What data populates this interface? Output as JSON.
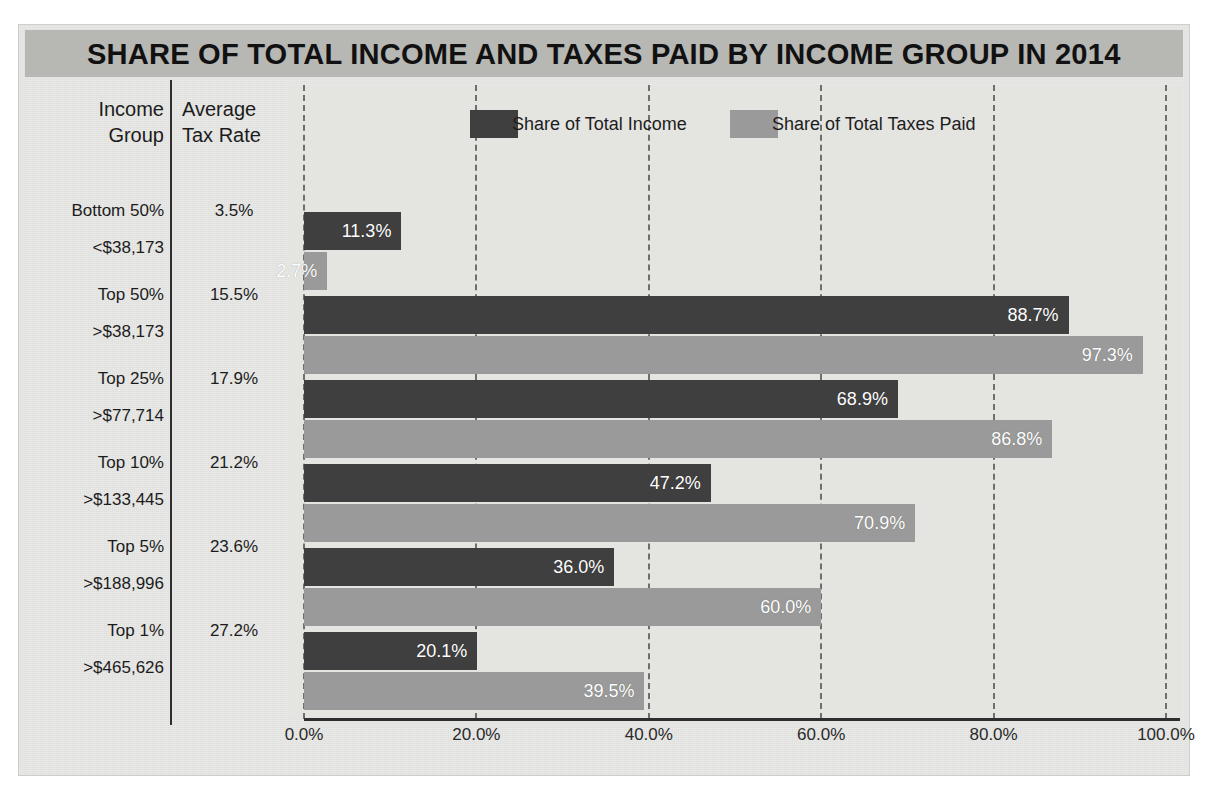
{
  "title": "SHARE OF TOTAL INCOME AND TAXES PAID BY INCOME GROUP IN 2014",
  "table": {
    "headers": {
      "income_group_line1": "Income",
      "income_group_line2": "Group",
      "avg_rate_line1": "Average",
      "avg_rate_line2": "Tax Rate"
    },
    "rows": [
      {
        "group": "Bottom 50%",
        "threshold": "<$38,173",
        "avg_tax_rate": "3.5%"
      },
      {
        "group": "Top 50%",
        "threshold": ">$38,173",
        "avg_tax_rate": "15.5%"
      },
      {
        "group": "Top 25%",
        "threshold": ">$77,714",
        "avg_tax_rate": "17.9%"
      },
      {
        "group": "Top 10%",
        "threshold": ">$133,445",
        "avg_tax_rate": "21.2%"
      },
      {
        "group": "Top 5%",
        "threshold": ">$188,996",
        "avg_tax_rate": "23.6%"
      },
      {
        "group": "Top 1%",
        "threshold": ">$465,626",
        "avg_tax_rate": "27.2%"
      }
    ]
  },
  "colors": {
    "income_bar": "#3f3f3f",
    "taxes_bar": "#9a9a9a",
    "title_bar_bg": "#b7b7b4",
    "plot_bg": "#e4e4e1",
    "gridline": "#6e6e6c"
  },
  "chart_data": {
    "type": "bar",
    "orientation": "horizontal",
    "title": "SHARE OF TOTAL INCOME AND TAXES PAID BY INCOME GROUP IN 2014",
    "xlabel": "",
    "ylabel": "",
    "categories": [
      "Bottom 50%",
      "Top 50%",
      "Top 25%",
      "Top 10%",
      "Top 5%",
      "Top 1%"
    ],
    "series": [
      {
        "name": "Share of Total Income",
        "color": "#3f3f3f",
        "values": [
          11.3,
          88.7,
          68.9,
          47.2,
          36.0,
          20.1
        ],
        "labels": [
          "11.3%",
          "88.7%",
          "68.9%",
          "47.2%",
          "36.0%",
          "20.1%"
        ]
      },
      {
        "name": "Share of Total Taxes Paid",
        "color": "#9a9a9a",
        "values": [
          2.7,
          97.3,
          86.8,
          70.9,
          60.0,
          39.5
        ],
        "labels": [
          "2.7%",
          "97.3%",
          "86.8%",
          "70.9%",
          "60.0%",
          "39.5%"
        ]
      }
    ],
    "xlim": [
      0,
      100
    ],
    "xticks": [
      0,
      20,
      40,
      60,
      80,
      100
    ],
    "xticklabels": [
      "0.0%",
      "20.0%",
      "40.0%",
      "60.0%",
      "80.0%",
      "100.0%"
    ],
    "grid": true,
    "grid_style": "dashed-vertical",
    "legend_position": "top"
  }
}
